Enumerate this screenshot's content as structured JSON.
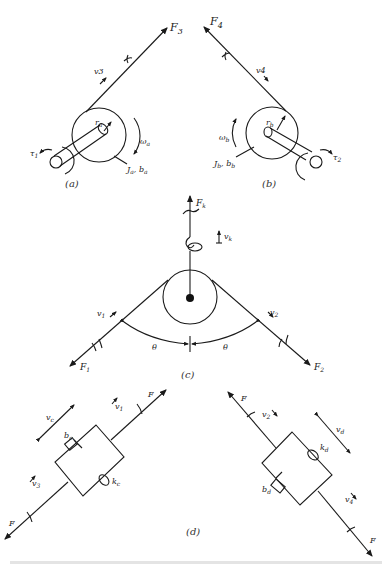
{
  "figure": {
    "panels": {
      "a": {
        "caption": "(a)",
        "force": "F",
        "force_sub": "3",
        "velocity": "v3",
        "radius": "r",
        "radius_sub": "a",
        "omega": "ω",
        "omega_sub": "a",
        "torque": "τ",
        "torque_sub": "1",
        "inertia_label": "J",
        "inertia_sub": "a",
        "damping_label": ", b",
        "damping_sub": "a"
      },
      "b": {
        "caption": "(b)",
        "force": "F",
        "force_sub": "4",
        "velocity": "v4",
        "radius": "r",
        "radius_sub": "b",
        "omega": "ω",
        "omega_sub": "b",
        "torque": "τ",
        "torque_sub": "2",
        "inertia_label": "J",
        "inertia_sub": "b",
        "damping_label": ", b",
        "damping_sub": "b"
      },
      "c": {
        "caption": "(c)",
        "force_k": "F",
        "force_k_sub": "k",
        "velocity_k": "v",
        "velocity_k_sub": "k",
        "v1": "v",
        "v1_sub": "1",
        "v2": "v",
        "v2_sub": "2",
        "f1": "F",
        "f1_sub": "1",
        "f2": "F",
        "f2_sub": "2",
        "theta_left": "θ",
        "theta_right": "θ"
      },
      "d": {
        "caption": "(d)",
        "left": {
          "force_top": "F",
          "force_bottom": "F",
          "v1": "v",
          "v1_sub": "1",
          "v3": "v",
          "v3_sub": "3",
          "vc": "v",
          "vc_sub": "c",
          "damper": "b",
          "damper_sub": "c",
          "spring": "k",
          "spring_sub": "c"
        },
        "right": {
          "force_top": "F",
          "force_bottom": "F",
          "v2": "v",
          "v2_sub": "2",
          "v4": "v",
          "v4_sub": "4",
          "vd": "v",
          "vd_sub": "d",
          "damper": "b",
          "damper_sub": "d",
          "spring": "k",
          "spring_sub": "d"
        }
      }
    },
    "footer_caption": "(faint caption text, illegible)"
  }
}
